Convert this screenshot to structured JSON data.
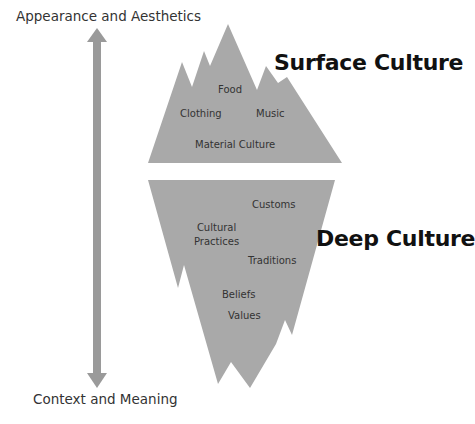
{
  "diagram": {
    "type": "iceberg",
    "colors": {
      "iceberg": "#a9a9a9",
      "arrow": "#9a9a9a",
      "text": "#262626",
      "background": "#ffffff"
    },
    "axis": {
      "top_label": "Appearance and Aesthetics",
      "bottom_label": "Context and Meaning",
      "direction": "bidirectional-vertical"
    },
    "surface": {
      "title": "Surface Culture",
      "items": [
        "Food",
        "Clothing",
        "Music",
        "Material Culture"
      ]
    },
    "deep": {
      "title": "Deep Culture",
      "items": [
        "Customs",
        "Cultural Practices",
        "Traditions",
        "Beliefs",
        "Values"
      ],
      "cultural_practices_line1": "Cultural",
      "cultural_practices_line2": "Practices"
    }
  }
}
